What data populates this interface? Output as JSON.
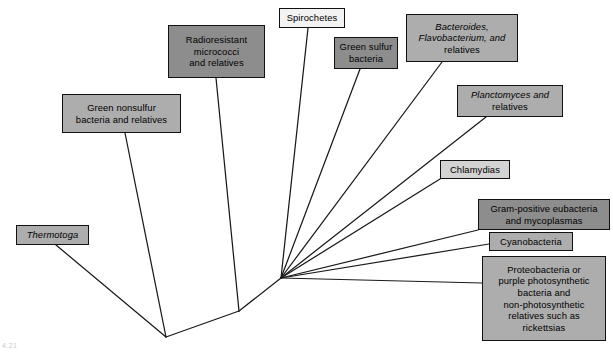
{
  "figure": {
    "background_color": "#ffffff",
    "line_color": "#1a1a1a",
    "corner_mark": "4.21"
  },
  "palette": {
    "fill_mid": "#adadad",
    "fill_dark": "#8d8d8d",
    "fill_light": "#d3d3d3",
    "fill_white": "#f3f3f3",
    "border": "#111111",
    "text": "#000000"
  },
  "taxa": [
    {
      "id": "green-nonsulfur",
      "lines": [
        {
          "text": "Green nonsulfur",
          "italic": false
        },
        {
          "text": "bacteria and relatives",
          "italic": false
        }
      ],
      "plain_label": "Green nonsulfur bacteria and relatives",
      "fill": "fill-mid",
      "box": {
        "left": 62,
        "top": 94,
        "width": 119,
        "height": 39
      },
      "tip": {
        "x": 125,
        "y": 133
      }
    },
    {
      "id": "radioresistant-micrococci",
      "lines": [
        {
          "text": "Radioresistant",
          "italic": false
        },
        {
          "text": "micrococci",
          "italic": false
        },
        {
          "text": "and relatives",
          "italic": false
        }
      ],
      "plain_label": "Radioresistant micrococci and relatives",
      "fill": "fill-dark",
      "box": {
        "left": 168,
        "top": 25,
        "width": 97,
        "height": 53
      },
      "tip": {
        "x": 216,
        "y": 78
      }
    },
    {
      "id": "spirochetes",
      "lines": [
        {
          "text": "Spirochetes",
          "italic": false
        }
      ],
      "plain_label": "Spirochetes",
      "fill": "fill-white",
      "box": {
        "left": 279,
        "top": 8,
        "width": 66,
        "height": 20
      },
      "tip": {
        "x": 308,
        "y": 28
      }
    },
    {
      "id": "green-sulfur",
      "lines": [
        {
          "text": "Green sulfur",
          "italic": false
        },
        {
          "text": "bacteria",
          "italic": false
        }
      ],
      "plain_label": "Green sulfur bacteria",
      "fill": "fill-dark",
      "box": {
        "left": 334,
        "top": 37,
        "width": 64,
        "height": 32
      },
      "tip": {
        "x": 360,
        "y": 69
      }
    },
    {
      "id": "bacteroides-flavobacterium",
      "lines": [
        {
          "text": "Bacteroides,",
          "italic": true
        },
        {
          "text": "Flavobacterium, and",
          "italic": true
        },
        {
          "text": "relatives",
          "italic": false
        }
      ],
      "plain_label": "Bacteroides, Flavobacterium, and relatives",
      "fill": "fill-mid",
      "box": {
        "left": 406,
        "top": 14,
        "width": 112,
        "height": 48
      },
      "tip": {
        "x": 442,
        "y": 62
      }
    },
    {
      "id": "planctomyces",
      "lines": [
        {
          "text": "Planctomyces and",
          "italic": true
        },
        {
          "text": "relatives",
          "italic": false
        }
      ],
      "plain_label": "Planctomyces and relatives",
      "fill": "fill-mid",
      "box": {
        "left": 457,
        "top": 85,
        "width": 106,
        "height": 32
      },
      "tip": {
        "x": 486,
        "y": 117
      }
    },
    {
      "id": "chlamydias",
      "lines": [
        {
          "text": "Chlamydias",
          "italic": false
        }
      ],
      "plain_label": "Chlamydias",
      "fill": "fill-light",
      "box": {
        "left": 440,
        "top": 160,
        "width": 70,
        "height": 19
      },
      "tip": {
        "x": 440,
        "y": 179
      }
    },
    {
      "id": "gram-positive-eubacteria",
      "lines": [
        {
          "text": "Gram-positive eubacteria",
          "italic": false
        },
        {
          "text": "and mycoplasmas",
          "italic": false
        }
      ],
      "plain_label": "Gram-positive eubacteria and mycoplasmas",
      "fill": "fill-dark",
      "box": {
        "left": 478,
        "top": 199,
        "width": 132,
        "height": 31
      },
      "tip": {
        "x": 478,
        "y": 230
      }
    },
    {
      "id": "cyanobacteria",
      "lines": [
        {
          "text": "Cyanobacteria",
          "italic": false
        }
      ],
      "plain_label": "Cyanobacteria",
      "fill": "fill-mid",
      "box": {
        "left": 489,
        "top": 232,
        "width": 84,
        "height": 19
      },
      "tip": {
        "x": 489,
        "y": 244
      }
    },
    {
      "id": "proteobacteria",
      "lines": [
        {
          "text": "Proteobacteria or",
          "italic": false
        },
        {
          "text": "purple photosynthetic",
          "italic": false
        },
        {
          "text": "bacteria and",
          "italic": false
        },
        {
          "text": "non-photosynthetic",
          "italic": false
        },
        {
          "text": "relatives such as",
          "italic": false
        },
        {
          "text": "rickettsias",
          "italic": false
        }
      ],
      "plain_label": "Proteobacteria or purple photosynthetic bacteria and non-photosynthetic relatives such as rickettsias",
      "fill": "fill-mid",
      "box": {
        "left": 482,
        "top": 256,
        "width": 124,
        "height": 85
      },
      "tip": {
        "x": 482,
        "y": 283
      }
    },
    {
      "id": "thermotoga",
      "lines": [
        {
          "text": "Thermotoga",
          "italic": true
        }
      ],
      "plain_label": "Thermotoga",
      "fill": "fill-mid",
      "box": {
        "left": 16,
        "top": 225,
        "width": 73,
        "height": 20
      },
      "tip": {
        "x": 56,
        "y": 245
      }
    }
  ],
  "tree_nodes": {
    "root": {
      "x": 166,
      "y": 337
    },
    "node_radioresistant": {
      "x": 239,
      "y": 311
    },
    "fan_node": {
      "x": 281,
      "y": 278
    }
  },
  "branches": [
    {
      "name": "thermotoga-branch",
      "from": "root",
      "to": "thermotoga-tip"
    },
    {
      "name": "root-to-node-radioresistant",
      "from": "root",
      "to": "node_radioresistant"
    },
    {
      "name": "green-nonsulfur-branch",
      "from": "root",
      "to": "green-nonsulfur-tip"
    },
    {
      "name": "radioresistant-branch",
      "from": "node_radioresistant",
      "to": "radioresistant-tip"
    },
    {
      "name": "node-to-fan",
      "from": "node_radioresistant",
      "to": "fan_node"
    },
    {
      "name": "spirochetes-branch",
      "from": "fan_node",
      "to": "spirochetes-tip"
    },
    {
      "name": "green-sulfur-branch",
      "from": "fan_node",
      "to": "green-sulfur-tip"
    },
    {
      "name": "bacteroides-branch",
      "from": "fan_node",
      "to": "bacteroides-tip"
    },
    {
      "name": "planctomyces-branch",
      "from": "fan_node",
      "to": "planctomyces-tip"
    },
    {
      "name": "chlamydias-branch",
      "from": "fan_node",
      "to": "chlamydias-tip"
    },
    {
      "name": "gram-positive-branch",
      "from": "fan_node",
      "to": "gram-positive-tip"
    },
    {
      "name": "cyanobacteria-branch",
      "from": "fan_node",
      "to": "cyanobacteria-tip"
    },
    {
      "name": "proteobacteria-branch",
      "from": "fan_node",
      "to": "proteobacteria-tip"
    }
  ]
}
